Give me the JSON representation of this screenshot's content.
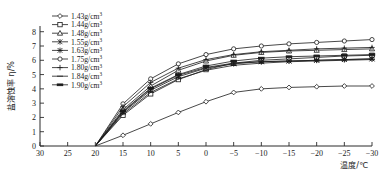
{
  "chart_data": {
    "type": "line",
    "title": "",
    "xlabel": "温度/℃",
    "ylabel": "盐溶蚀率 η/%",
    "xlim": [
      30,
      -30
    ],
    "ylim": [
      0,
      8.4
    ],
    "x_reversed": true,
    "grid": false,
    "legend_position": "top-left",
    "x_ticks": [
      30,
      25,
      20,
      15,
      10,
      5,
      0,
      -5,
      -10,
      -15,
      -20,
      -25,
      -30
    ],
    "x_tick_labels": [
      "30",
      "25",
      "20",
      "15",
      "10",
      "5",
      "0",
      "-5",
      "-10",
      "-15",
      "-20",
      "-25",
      "-30"
    ],
    "y_ticks": [
      0,
      1,
      2,
      3,
      4,
      5,
      6,
      7,
      8
    ],
    "y_tick_labels": [
      "0",
      "1",
      "2",
      "3",
      "4",
      "5",
      "6",
      "7",
      "8"
    ],
    "x": [
      20,
      15,
      10,
      5,
      0,
      -5,
      -10,
      -15,
      -20,
      -25,
      -30
    ],
    "series": [
      {
        "name": "1.43g/cm³",
        "marker": "diamond",
        "values": [
          0,
          0.75,
          1.55,
          2.35,
          3.1,
          3.75,
          4.0,
          4.1,
          4.15,
          4.2,
          4.2
        ]
      },
      {
        "name": "1.44g/cm³",
        "marker": "square",
        "values": [
          0,
          2.15,
          3.65,
          4.65,
          5.35,
          5.8,
          6.0,
          6.1,
          6.2,
          6.3,
          6.35
        ]
      },
      {
        "name": "1.48g/cm³",
        "marker": "triangle",
        "values": [
          0,
          2.55,
          4.2,
          5.3,
          5.95,
          6.35,
          6.55,
          6.65,
          6.7,
          6.75,
          6.8
        ]
      },
      {
        "name": "1.55g/cm³",
        "marker": "star",
        "values": [
          0,
          2.35,
          3.9,
          4.85,
          5.45,
          5.75,
          5.9,
          5.95,
          6.0,
          6.05,
          6.1
        ]
      },
      {
        "name": "1.63g/cm³",
        "marker": "star-solid",
        "values": [
          0,
          2.4,
          4.0,
          4.95,
          5.5,
          5.8,
          5.9,
          5.95,
          6.0,
          6.05,
          6.1
        ]
      },
      {
        "name": "1.75g/cm³",
        "marker": "circle",
        "values": [
          0,
          2.95,
          4.7,
          5.75,
          6.4,
          6.8,
          7.0,
          7.15,
          7.25,
          7.35,
          7.45
        ]
      },
      {
        "name": "1.80g/cm³",
        "marker": "plus",
        "values": [
          0,
          2.75,
          4.45,
          5.45,
          6.05,
          6.4,
          6.6,
          6.7,
          6.8,
          6.85,
          6.9
        ]
      },
      {
        "name": "1.84g/cm³",
        "marker": "dash",
        "values": [
          0,
          2.25,
          3.75,
          4.7,
          5.3,
          5.65,
          5.8,
          5.9,
          5.95,
          6.0,
          6.05
        ]
      },
      {
        "name": "1.90g/cm³",
        "marker": "dash-solid",
        "values": [
          0,
          2.45,
          4.05,
          5.0,
          5.6,
          5.95,
          6.15,
          6.25,
          6.3,
          6.35,
          6.4
        ]
      }
    ]
  },
  "legend": {
    "entries": [
      {
        "label": "1.43g/cm",
        "sup": "3",
        "marker": "diamond"
      },
      {
        "label": "1.44g/cm",
        "sup": "3",
        "marker": "square"
      },
      {
        "label": "1.48g/cm",
        "sup": "3",
        "marker": "triangle"
      },
      {
        "label": "1.55g/cm",
        "sup": "3",
        "marker": "star"
      },
      {
        "label": "1.63g/cm",
        "sup": "3",
        "marker": "star-solid"
      },
      {
        "label": "1.75g/cm",
        "sup": "3",
        "marker": "circle"
      },
      {
        "label": "1.80g/cm",
        "sup": "3",
        "marker": "plus"
      },
      {
        "label": "1.84g/cm",
        "sup": "3",
        "marker": "dash"
      },
      {
        "label": "1.90g/cm",
        "sup": "3",
        "marker": "dash-solid"
      }
    ]
  },
  "axes": {
    "x_title": "温度/℃",
    "y_title": "盐溶蚀率 η/%"
  },
  "colors": {
    "ink": "#1a1a1a",
    "background": "#ffffff"
  }
}
